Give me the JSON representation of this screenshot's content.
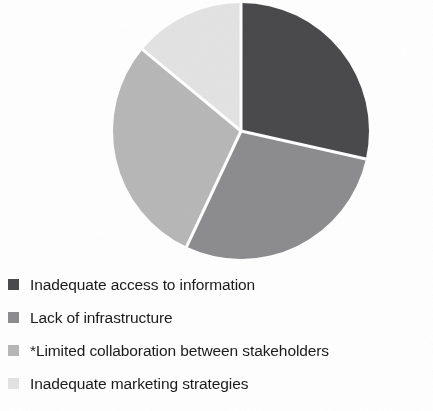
{
  "chart_data": {
    "type": "pie",
    "title": "",
    "subtitle": "",
    "xlabel": "",
    "ylabel": "",
    "grid": false,
    "legend_position": "bottom-left",
    "start_angle_deg": 0,
    "direction": "clockwise",
    "center": {
      "x": 241,
      "y": 131
    },
    "radius": 128,
    "separator_color": "#ffffff",
    "separator_width": 3,
    "categories": [
      "Inadequate access to information",
      "Lack of infrastructure",
      "*Limited collaboration between stakeholders",
      "Inadequate marketing strategies"
    ],
    "values": [
      28.5,
      28.5,
      29.0,
      14.0
    ],
    "colors": [
      "#4a4a4c",
      "#8d8d8f",
      "#b8b8b8",
      "#e3e3e3"
    ],
    "slices": [
      {
        "label": "Inadequate access to information",
        "value": 28.5,
        "color": "#4a4a4c",
        "start_angle_deg": 0,
        "end_angle_deg": 102.6
      },
      {
        "label": "Lack of infrastructure",
        "value": 28.5,
        "color": "#8d8d8f",
        "start_angle_deg": 102.6,
        "end_angle_deg": 205.2
      },
      {
        "label": "*Limited collaboration between stakeholders",
        "value": 29.0,
        "color": "#b8b8b8",
        "start_angle_deg": 205.2,
        "end_angle_deg": 309.6
      },
      {
        "label": "Inadequate marketing strategies",
        "value": 14.0,
        "color": "#e3e3e3",
        "start_angle_deg": 309.6,
        "end_angle_deg": 360
      }
    ]
  },
  "legend": {
    "items": [
      {
        "label": "Inadequate access to information",
        "color": "#4a4a4c",
        "swatch": "legend-swatch-square"
      },
      {
        "label": "Lack of infrastructure",
        "color": "#8d8d8f",
        "swatch": "legend-swatch-square"
      },
      {
        "label": "*Limited collaboration between stakeholders",
        "color": "#b8b8b8",
        "swatch": "legend-swatch-square"
      },
      {
        "label": "Inadequate marketing strategies",
        "color": "#e3e3e3",
        "swatch": "legend-swatch-square"
      }
    ]
  }
}
